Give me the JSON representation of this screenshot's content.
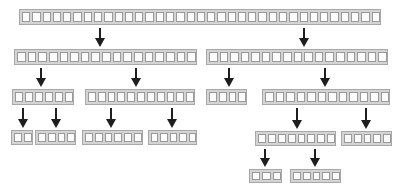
{
  "diagram": {
    "type": "tree-of-cell-arrays",
    "colors": {
      "node_fill": "#d4d4d4",
      "node_border": "#a8a8a8",
      "cell_fill": "#fbfbfb",
      "cell_border": "#9a9a9a",
      "arrow": "#1e1e1e"
    },
    "nodes": [
      {
        "id": "root",
        "level": 1,
        "cells": 35,
        "x": 19,
        "y": 9,
        "w": 362,
        "h": 16
      },
      {
        "id": "l2-a",
        "level": 2,
        "cells": 17,
        "x": 14,
        "y": 49,
        "w": 183,
        "h": 16
      },
      {
        "id": "l2-b",
        "level": 2,
        "cells": 17,
        "x": 206,
        "y": 49,
        "w": 182,
        "h": 16
      },
      {
        "id": "l3-a",
        "level": 3,
        "cells": 6,
        "x": 12,
        "y": 89,
        "w": 62,
        "h": 16
      },
      {
        "id": "l3-b",
        "level": 3,
        "cells": 11,
        "x": 85,
        "y": 89,
        "w": 110,
        "h": 16
      },
      {
        "id": "l3-c",
        "level": 3,
        "cells": 4,
        "x": 206,
        "y": 89,
        "w": 41,
        "h": 16
      },
      {
        "id": "l3-d",
        "level": 3,
        "cells": 12,
        "x": 262,
        "y": 89,
        "w": 128,
        "h": 16
      },
      {
        "id": "l4-a",
        "level": 4,
        "cells": 2,
        "x": 11,
        "y": 130,
        "w": 22,
        "h": 15
      },
      {
        "id": "l4-b",
        "level": 4,
        "cells": 4,
        "x": 35,
        "y": 130,
        "w": 41,
        "h": 15
      },
      {
        "id": "l4-c",
        "level": 4,
        "cells": 6,
        "x": 82,
        "y": 130,
        "w": 61,
        "h": 15
      },
      {
        "id": "l4-d",
        "level": 4,
        "cells": 5,
        "x": 148,
        "y": 130,
        "w": 49,
        "h": 15
      },
      {
        "id": "l4-e",
        "level": 4,
        "cells": 8,
        "x": 255,
        "y": 131,
        "w": 81,
        "h": 15
      },
      {
        "id": "l4-f",
        "level": 4,
        "cells": 5,
        "x": 341,
        "y": 131,
        "w": 51,
        "h": 15
      },
      {
        "id": "l5-a",
        "level": 5,
        "cells": 3,
        "x": 249,
        "y": 169,
        "w": 33,
        "h": 14
      },
      {
        "id": "l5-b",
        "level": 5,
        "cells": 5,
        "x": 290,
        "y": 169,
        "w": 51,
        "h": 14
      }
    ],
    "edges": [
      {
        "from": "root",
        "to": "l2-a",
        "x": 100,
        "y1": 28,
        "y2": 47
      },
      {
        "from": "root",
        "to": "l2-b",
        "x": 304,
        "y1": 28,
        "y2": 47
      },
      {
        "from": "l2-a",
        "to": "l3-a",
        "x": 41,
        "y1": 68,
        "y2": 87
      },
      {
        "from": "l2-a",
        "to": "l3-b",
        "x": 136,
        "y1": 68,
        "y2": 87
      },
      {
        "from": "l2-b",
        "to": "l3-c",
        "x": 229,
        "y1": 68,
        "y2": 87
      },
      {
        "from": "l2-b",
        "to": "l3-d",
        "x": 325,
        "y1": 68,
        "y2": 87
      },
      {
        "from": "l3-a",
        "to": "l4-a",
        "x": 23,
        "y1": 108,
        "y2": 128
      },
      {
        "from": "l3-a",
        "to": "l4-b",
        "x": 56,
        "y1": 108,
        "y2": 128
      },
      {
        "from": "l3-b",
        "to": "l4-c",
        "x": 111,
        "y1": 108,
        "y2": 128
      },
      {
        "from": "l3-b",
        "to": "l4-d",
        "x": 172,
        "y1": 108,
        "y2": 128
      },
      {
        "from": "l3-d",
        "to": "l4-e",
        "x": 297,
        "y1": 108,
        "y2": 129
      },
      {
        "from": "l3-d",
        "to": "l4-f",
        "x": 366,
        "y1": 108,
        "y2": 129
      },
      {
        "from": "l4-e",
        "to": "l5-a",
        "x": 265,
        "y1": 149,
        "y2": 167
      },
      {
        "from": "l4-e",
        "to": "l5-b",
        "x": 315,
        "y1": 149,
        "y2": 167
      }
    ]
  }
}
